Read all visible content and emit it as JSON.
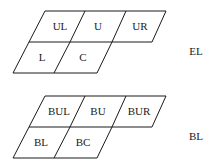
{
  "groups": [
    {
      "name": "EL",
      "label": "EL",
      "cells": [
        "UL",
        "U",
        "UR",
        "L",
        "C"
      ]
    },
    {
      "name": "BL",
      "label": "BL",
      "cells": [
        "BUL",
        "BU",
        "BUR",
        "BL",
        "BC"
      ]
    }
  ],
  "colors": {
    "line": "#1a1a1a",
    "text": "#1a1a1a",
    "background": "#ffffff"
  }
}
